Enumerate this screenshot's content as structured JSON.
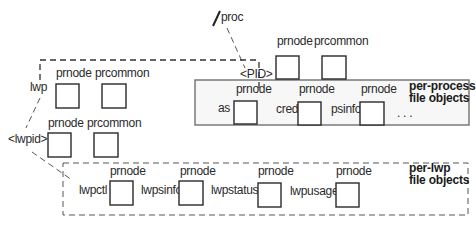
{
  "diagram": {
    "root": {
      "slash": "/",
      "label": "proc"
    },
    "pid": {
      "label": "<PID>",
      "objects": [
        {
          "label": "prnode"
        },
        {
          "label": "prcommon"
        }
      ]
    },
    "per_process": {
      "title_line1": "per-process",
      "title_line2": "file objects",
      "files": [
        {
          "name": "as",
          "type": "prnode"
        },
        {
          "name": "cred",
          "type": "prnode"
        },
        {
          "name": "psinfo",
          "type": "prnode"
        }
      ],
      "ellipsis": ". . ."
    },
    "lwp": {
      "label": "lwp",
      "objects": [
        {
          "label": "prnode"
        },
        {
          "label": "prcommon"
        }
      ]
    },
    "lwpid": {
      "label": "<lwpid>",
      "objects": [
        {
          "label": "prnode"
        },
        {
          "label": "prcommon"
        }
      ]
    },
    "per_lwp": {
      "title_line1": "per-lwp",
      "title_line2": "file objects",
      "files": [
        {
          "name": "lwpctl",
          "type": "prnode"
        },
        {
          "name": "lwpsinfo",
          "type": "prnode"
        },
        {
          "name": "lwpstatus",
          "type": "prnode"
        },
        {
          "name": "lwpusage",
          "type": "prnode"
        }
      ]
    },
    "colors": {
      "stroke": "#2a2a2a",
      "panel_fill": "#f7f7f7",
      "panel_border": "#666666"
    }
  }
}
